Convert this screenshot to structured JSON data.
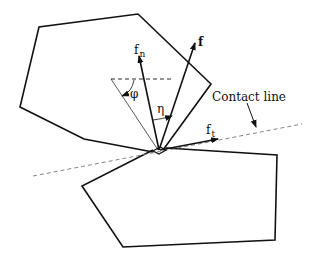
{
  "diagram": {
    "labels": {
      "f_n_main": "f",
      "f_n_sub": "n",
      "f": "f",
      "phi": "φ",
      "eta": "η",
      "contact_line": "Contact line",
      "f_t_main": "f",
      "f_t_sub": "t"
    },
    "colors": {
      "stroke": "#111111",
      "dashed": "#777777",
      "background": "#ffffff"
    }
  }
}
